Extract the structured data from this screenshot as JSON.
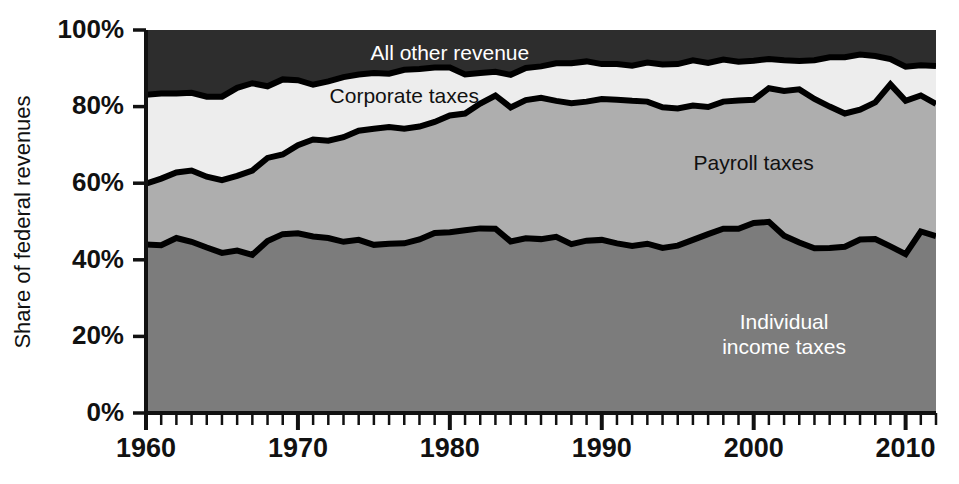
{
  "chart_data": {
    "type": "area",
    "stacked": true,
    "title": "",
    "xlabel": "",
    "ylabel": "Share of federal revenues",
    "ylim": [
      0,
      100
    ],
    "xlim": [
      1960,
      2012
    ],
    "grid": false,
    "legend_position": "inline-labels",
    "y_tick_labels": [
      "0%",
      "20%",
      "40%",
      "60%",
      "80%",
      "100%"
    ],
    "y_tick_values": [
      0,
      20,
      40,
      60,
      80,
      100
    ],
    "x_tick_labels": [
      "1960",
      "1970",
      "1980",
      "1990",
      "2000",
      "2010"
    ],
    "x_tick_values": [
      1960,
      1970,
      1980,
      1990,
      2000,
      2010
    ],
    "x_minor_tick_step": 1,
    "x": [
      1960,
      1961,
      1962,
      1963,
      1964,
      1965,
      1966,
      1967,
      1968,
      1969,
      1970,
      1971,
      1972,
      1973,
      1974,
      1975,
      1976,
      1977,
      1978,
      1979,
      1980,
      1981,
      1982,
      1983,
      1984,
      1985,
      1986,
      1987,
      1988,
      1989,
      1990,
      1991,
      1992,
      1993,
      1994,
      1995,
      1996,
      1997,
      1998,
      1999,
      2000,
      2001,
      2002,
      2003,
      2004,
      2005,
      2006,
      2007,
      2008,
      2009,
      2010,
      2011,
      2012
    ],
    "series": [
      {
        "name": "Individual income taxes",
        "color": "#7c7c7c",
        "label_color": "light",
        "label_lines": [
          "Individual",
          "income taxes"
        ],
        "values": [
          44.0,
          43.8,
          45.7,
          44.7,
          43.2,
          41.8,
          42.4,
          41.3,
          44.9,
          46.7,
          46.9,
          46.1,
          45.7,
          44.7,
          45.2,
          43.9,
          44.2,
          44.3,
          45.3,
          47.0,
          47.2,
          47.7,
          48.2,
          48.1,
          44.8,
          45.6,
          45.4,
          46.0,
          44.1,
          45.0,
          45.2,
          44.3,
          43.6,
          44.2,
          43.1,
          43.7,
          45.2,
          46.7,
          48.1,
          48.1,
          49.6,
          49.9,
          46.3,
          44.5,
          43.0,
          43.1,
          43.4,
          45.3,
          45.4,
          43.5,
          41.5,
          47.4,
          46.2
        ]
      },
      {
        "name": "Payroll taxes",
        "color": "#aeaeae",
        "label_color": "dark",
        "label_lines": [
          "Payroll taxes"
        ],
        "values": [
          15.9,
          17.4,
          17.1,
          18.6,
          18.5,
          19.0,
          19.5,
          22.0,
          21.7,
          20.8,
          23.0,
          25.3,
          25.4,
          27.3,
          28.5,
          30.3,
          30.5,
          29.9,
          29.5,
          29.0,
          30.5,
          30.5,
          32.6,
          34.8,
          35.0,
          36.1,
          36.9,
          35.5,
          36.8,
          36.3,
          36.8,
          37.5,
          37.9,
          37.1,
          36.7,
          35.8,
          35.1,
          33.2,
          33.2,
          33.5,
          32.2,
          34.9,
          37.8,
          40.0,
          39.0,
          36.9,
          34.8,
          33.9,
          35.7,
          42.3,
          40.0,
          35.5,
          34.5
        ]
      },
      {
        "name": "Corporate taxes",
        "color": "#ededed",
        "label_color": "dark",
        "label_lines": [
          "Corporate taxes"
        ],
        "values": [
          23.2,
          22.2,
          20.6,
          20.3,
          20.9,
          21.8,
          23.0,
          22.8,
          18.7,
          19.6,
          17.0,
          14.3,
          15.5,
          15.7,
          14.7,
          14.6,
          13.9,
          15.4,
          15.0,
          14.2,
          12.5,
          10.2,
          8.0,
          6.2,
          8.5,
          8.4,
          8.2,
          9.8,
          10.4,
          10.5,
          9.1,
          9.3,
          9.2,
          10.2,
          11.2,
          11.6,
          11.8,
          11.5,
          11.0,
          10.1,
          10.2,
          7.6,
          8.0,
          7.4,
          10.1,
          12.9,
          14.7,
          14.4,
          12.1,
          6.6,
          8.9,
          7.9,
          9.9
        ]
      },
      {
        "name": "All other revenue",
        "color": "#2d2d2d",
        "label_color": "light",
        "label_lines": [
          "All other revenue"
        ],
        "values": [
          16.9,
          16.6,
          16.6,
          16.4,
          17.4,
          17.4,
          15.1,
          13.9,
          14.7,
          12.9,
          13.1,
          14.3,
          13.4,
          12.3,
          11.6,
          11.2,
          11.4,
          10.4,
          10.2,
          9.8,
          9.8,
          11.6,
          11.2,
          10.9,
          11.7,
          9.9,
          9.5,
          8.7,
          8.7,
          8.2,
          8.9,
          8.9,
          9.3,
          8.5,
          9.0,
          8.9,
          7.9,
          8.6,
          7.7,
          8.3,
          8.0,
          7.6,
          7.9,
          8.1,
          7.9,
          7.1,
          7.1,
          6.4,
          6.8,
          7.6,
          9.6,
          9.2,
          9.4
        ]
      }
    ],
    "series_label_positions": [
      {
        "name": "Individual income taxes",
        "x": 2002,
        "y": 20
      },
      {
        "name": "Payroll taxes",
        "x": 2000,
        "y": 65
      },
      {
        "name": "Corporate taxes",
        "x": 1977,
        "y": 82.5
      },
      {
        "name": "All other revenue",
        "x": 1980,
        "y": 93.5
      }
    ]
  },
  "axis": {
    "y_title": "Share of federal revenues"
  }
}
